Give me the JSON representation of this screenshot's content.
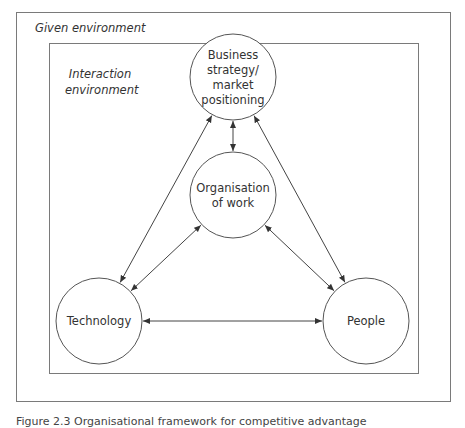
{
  "environments": {
    "given": "Given environment",
    "interaction_line1": "Interaction",
    "interaction_line2": "environment"
  },
  "nodes": {
    "business": {
      "lines": [
        "Business",
        "strategy/",
        "market",
        "positioning"
      ],
      "cx": 233,
      "cy": 77,
      "r": 43
    },
    "organisation": {
      "lines": [
        "Organisation",
        "of work"
      ],
      "cx": 233,
      "cy": 195,
      "r": 43
    },
    "technology": {
      "lines": [
        "Technology"
      ],
      "cx": 99,
      "cy": 321,
      "r": 43
    },
    "people": {
      "lines": [
        "People"
      ],
      "cx": 366,
      "cy": 321,
      "r": 43
    }
  },
  "edges": [
    {
      "from": "business",
      "to": "organisation",
      "type": "bidirectional"
    },
    {
      "from": "business",
      "to": "technology",
      "type": "bidirectional"
    },
    {
      "from": "business",
      "to": "people",
      "type": "bidirectional"
    },
    {
      "from": "organisation",
      "to": "technology",
      "type": "bidirectional"
    },
    {
      "from": "organisation",
      "to": "people",
      "type": "bidirectional"
    },
    {
      "from": "technology",
      "to": "people",
      "type": "bidirectional"
    }
  ],
  "caption": "Figure 2.3    Organisational framework for competitive advantage"
}
